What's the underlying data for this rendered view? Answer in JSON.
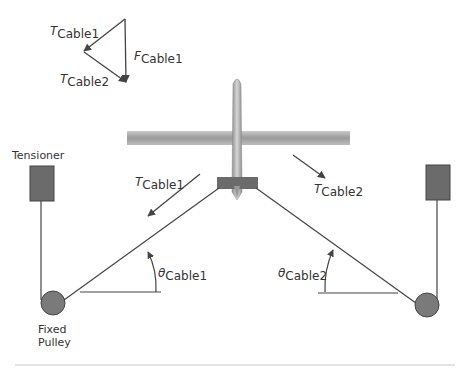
{
  "diagram": {
    "force_triangle": {
      "t_cable1": {
        "sym": "T",
        "sub": "Cable1"
      },
      "f_cable1": {
        "sym": "F",
        "sub": "Cable1"
      },
      "t_cable2": {
        "sym": "T",
        "sub": "Cable2"
      }
    },
    "left_side": {
      "tensioner_label": "Tensioner",
      "pulley_label_line1": "Fixed",
      "pulley_label_line2": "Pulley",
      "tension": {
        "sym": "T",
        "sub": "Cable1"
      },
      "angle": {
        "sym": "θ",
        "sub": "Cable1"
      }
    },
    "right_side": {
      "tension": {
        "sym": "T",
        "sub": "Cable2"
      },
      "angle": {
        "sym": "θ",
        "sub": "Cable2"
      }
    },
    "colors": {
      "box": "#6b6b6b",
      "pulley": "#7a7a7a",
      "line": "#444444",
      "drone": "#a8a8a8"
    }
  }
}
